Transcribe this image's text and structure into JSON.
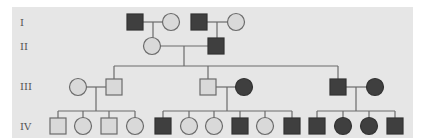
{
  "diagram": {
    "type": "pedigree",
    "colors": {
      "affected": "#3f3f3f",
      "unaffected": "#d9d9d9",
      "outline": "#6b6b6b",
      "background": "#e6e6e6",
      "label": "#555555"
    },
    "generations": [
      {
        "label": "I",
        "y": 22
      },
      {
        "label": "II",
        "y": 46
      },
      {
        "label": "III",
        "y": 86
      },
      {
        "label": "IV",
        "y": 126
      }
    ],
    "individuals": [
      {
        "id": "I-1",
        "gen": "I",
        "sex": "male",
        "affected": true,
        "x": 135,
        "y": 22
      },
      {
        "id": "I-2",
        "gen": "I",
        "sex": "female",
        "affected": false,
        "x": 171,
        "y": 22
      },
      {
        "id": "I-3",
        "gen": "I",
        "sex": "male",
        "affected": true,
        "x": 199,
        "y": 22
      },
      {
        "id": "I-4",
        "gen": "I",
        "sex": "female",
        "affected": false,
        "x": 236,
        "y": 22
      },
      {
        "id": "II-1",
        "gen": "II",
        "sex": "female",
        "affected": false,
        "x": 152,
        "y": 46
      },
      {
        "id": "II-2",
        "gen": "II",
        "sex": "male",
        "affected": true,
        "x": 216,
        "y": 46
      },
      {
        "id": "III-1",
        "gen": "III",
        "sex": "female",
        "affected": false,
        "x": 78,
        "y": 87
      },
      {
        "id": "III-2",
        "gen": "III",
        "sex": "male",
        "affected": false,
        "x": 114,
        "y": 87
      },
      {
        "id": "III-3",
        "gen": "III",
        "sex": "male",
        "affected": false,
        "x": 208,
        "y": 87
      },
      {
        "id": "III-4",
        "gen": "III",
        "sex": "female",
        "affected": true,
        "x": 244,
        "y": 87
      },
      {
        "id": "III-5",
        "gen": "III",
        "sex": "male",
        "affected": true,
        "x": 338,
        "y": 87
      },
      {
        "id": "III-6",
        "gen": "III",
        "sex": "female",
        "affected": true,
        "x": 375,
        "y": 87
      },
      {
        "id": "IV-1",
        "gen": "IV",
        "sex": "male",
        "affected": false,
        "x": 58,
        "y": 126
      },
      {
        "id": "IV-2",
        "gen": "IV",
        "sex": "female",
        "affected": false,
        "x": 83,
        "y": 126
      },
      {
        "id": "IV-3",
        "gen": "IV",
        "sex": "male",
        "affected": false,
        "x": 109,
        "y": 126
      },
      {
        "id": "IV-4",
        "gen": "IV",
        "sex": "female",
        "affected": false,
        "x": 135,
        "y": 126
      },
      {
        "id": "IV-5",
        "gen": "IV",
        "sex": "male",
        "affected": true,
        "x": 163,
        "y": 126
      },
      {
        "id": "IV-6",
        "gen": "IV",
        "sex": "female",
        "affected": false,
        "x": 189,
        "y": 126
      },
      {
        "id": "IV-7",
        "gen": "IV",
        "sex": "female",
        "affected": false,
        "x": 214,
        "y": 126
      },
      {
        "id": "IV-8",
        "gen": "IV",
        "sex": "male",
        "affected": true,
        "x": 240,
        "y": 126
      },
      {
        "id": "IV-9",
        "gen": "IV",
        "sex": "female",
        "affected": false,
        "x": 265,
        "y": 126
      },
      {
        "id": "IV-10",
        "gen": "IV",
        "sex": "male",
        "affected": true,
        "x": 292,
        "y": 126
      },
      {
        "id": "IV-11",
        "gen": "IV",
        "sex": "male",
        "affected": true,
        "x": 317,
        "y": 126
      },
      {
        "id": "IV-12",
        "gen": "IV",
        "sex": "female",
        "affected": true,
        "x": 343,
        "y": 126
      },
      {
        "id": "IV-13",
        "gen": "IV",
        "sex": "female",
        "affected": true,
        "x": 369,
        "y": 126
      },
      {
        "id": "IV-14",
        "gen": "IV",
        "sex": "male",
        "affected": true,
        "x": 395,
        "y": 126
      }
    ],
    "lines": [
      [
        143,
        22,
        163,
        22
      ],
      [
        153,
        22,
        153,
        38
      ],
      [
        207,
        22,
        228,
        22
      ],
      [
        217,
        22,
        217,
        38
      ],
      [
        160,
        46,
        208,
        46
      ],
      [
        184,
        46,
        184,
        66
      ],
      [
        114,
        66,
        338,
        66
      ],
      [
        114,
        66,
        114,
        79
      ],
      [
        338,
        66,
        338,
        79
      ],
      [
        86,
        87,
        106,
        87
      ],
      [
        96,
        87,
        96,
        111
      ],
      [
        58,
        111,
        135,
        111
      ],
      [
        58,
        111,
        58,
        118
      ],
      [
        83,
        111,
        83,
        118
      ],
      [
        109,
        111,
        109,
        118
      ],
      [
        135,
        111,
        135,
        118
      ],
      [
        216,
        87,
        236,
        87
      ],
      [
        227,
        87,
        227,
        111
      ],
      [
        163,
        111,
        292,
        111
      ],
      [
        163,
        111,
        163,
        118
      ],
      [
        189,
        111,
        189,
        118
      ],
      [
        214,
        111,
        214,
        118
      ],
      [
        240,
        111,
        240,
        118
      ],
      [
        265,
        111,
        265,
        118
      ],
      [
        292,
        111,
        292,
        118
      ],
      [
        208,
        66,
        208,
        79
      ],
      [
        346,
        87,
        367,
        87
      ],
      [
        356,
        87,
        356,
        111
      ],
      [
        317,
        111,
        395,
        111
      ],
      [
        317,
        111,
        317,
        118
      ],
      [
        343,
        111,
        343,
        118
      ],
      [
        369,
        111,
        369,
        118
      ],
      [
        395,
        111,
        395,
        118
      ]
    ]
  }
}
